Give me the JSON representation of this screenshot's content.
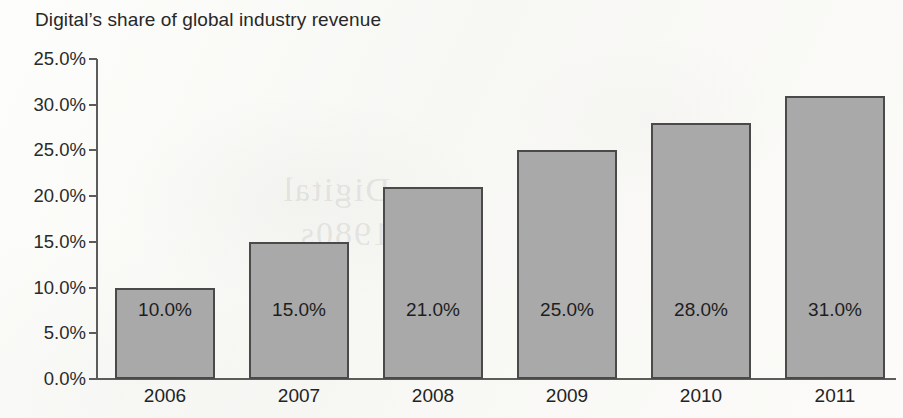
{
  "chart_data": {
    "type": "bar",
    "title": "Digital’s share of global industry revenue",
    "xlabel": "",
    "ylabel": "",
    "categories": [
      "2006",
      "2007",
      "2008",
      "2009",
      "2010",
      "2011"
    ],
    "values": [
      10.0,
      15.0,
      21.0,
      25.0,
      28.0,
      31.0
    ],
    "value_labels": [
      "10.0%",
      "15.0%",
      "21.0%",
      "25.0%",
      "28.0%",
      "31.0%"
    ],
    "series": [
      {
        "name": "Digital share of global industry revenue",
        "values": [
          10.0,
          15.0,
          21.0,
          25.0,
          28.0,
          31.0
        ]
      }
    ],
    "ylim": [
      0,
      35
    ],
    "y_tick_values": [
      35,
      30,
      25,
      20,
      15,
      10,
      5,
      0
    ],
    "y_tick_labels": [
      "25.0%",
      "30.0%",
      "25.0%",
      "20.0%",
      "15.0%",
      "10.0%",
      "5.0%",
      "0.0%"
    ],
    "grid": false,
    "legend": false,
    "legend_position": "none",
    "bar_color": "#a9a9a9",
    "bar_border_color": "#4a4a4a",
    "axis_color": "#5c5c5c",
    "text_color": "#272727",
    "background_color": "#fbfbf9"
  },
  "watermark": {
    "text": "Digital\n1980s"
  }
}
